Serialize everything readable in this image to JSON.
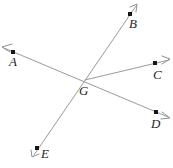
{
  "figure": {
    "background_color": "#ffffff",
    "line_color": "#9a9a9a",
    "dot_color": "#161616",
    "label_color": "#262626",
    "labels": {
      "A": "A",
      "B": "B",
      "C": "C",
      "D": "D",
      "E": "E",
      "G": "G"
    },
    "points": [
      {
        "name": "A",
        "label": "A",
        "x": 13,
        "y": 52,
        "label_x": 13,
        "label_y": 66
      },
      {
        "name": "B",
        "label": "B",
        "x": 130,
        "y": 14,
        "label_x": 133,
        "label_y": 28
      },
      {
        "name": "C",
        "label": "C",
        "x": 155,
        "y": 63,
        "label_x": 157,
        "label_y": 79
      },
      {
        "name": "D",
        "label": "D",
        "x": 156,
        "y": 112,
        "label_x": 155,
        "label_y": 128
      },
      {
        "name": "E",
        "label": "E",
        "x": 37,
        "y": 148,
        "label_x": 44,
        "label_y": 158
      },
      {
        "name": "G",
        "label": "G",
        "x": 85,
        "y": 80,
        "label_x": 83,
        "label_y": 95
      }
    ],
    "lines": [
      {
        "name": "line-A-G-D",
        "from": "A",
        "through": "G",
        "to": "D"
      },
      {
        "name": "line-E-G-B",
        "from": "E",
        "through": "G",
        "to": "B"
      },
      {
        "name": "ray-G-C",
        "from": "G",
        "to": "C"
      }
    ],
    "arrowheads": [
      {
        "name": "arrowhead-A",
        "tip_x": 2,
        "tip_y": 47
      },
      {
        "name": "arrowhead-B",
        "tip_x": 137,
        "tip_y": 4
      },
      {
        "name": "arrowhead-C",
        "tip_x": 170,
        "tip_y": 59
      },
      {
        "name": "arrowhead-D",
        "tip_x": 170,
        "tip_y": 118
      },
      {
        "name": "arrowhead-E",
        "tip_x": 32,
        "tip_y": 157
      }
    ]
  }
}
